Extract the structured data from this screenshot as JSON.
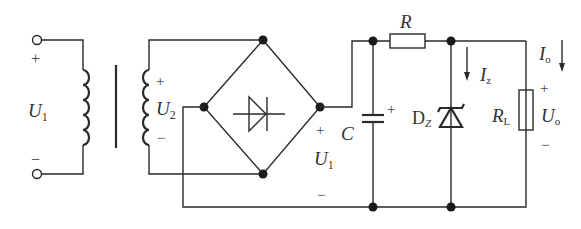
{
  "diagram": {
    "type": "circuit-schematic",
    "colors": {
      "line": "#2a2a2a",
      "node": "#1a1a1a",
      "text": "#333333",
      "background": "#ffffff"
    },
    "labels": {
      "input_voltage": {
        "main": "U",
        "sub": "1"
      },
      "input_plus": "+",
      "input_minus": "−",
      "secondary_voltage": {
        "main": "U",
        "sub": "2"
      },
      "secondary_plus": "+",
      "secondary_minus": "−",
      "rectified_voltage": {
        "main": "U",
        "sub": "1"
      },
      "rectified_plus": "+",
      "rectified_minus": "−",
      "capacitor": "C",
      "capacitor_plus": "+",
      "resistor": "R",
      "zener": {
        "main": "D",
        "sub": "Z"
      },
      "zener_current": {
        "main": "I",
        "sub": "z"
      },
      "load_resistor": {
        "main": "R",
        "sub": "L"
      },
      "output_current": {
        "main": "I",
        "sub": "o"
      },
      "output_voltage": {
        "main": "U",
        "sub": "o"
      },
      "output_plus": "+",
      "output_minus": "−"
    },
    "components": [
      {
        "id": "T",
        "kind": "transformer"
      },
      {
        "id": "bridge",
        "kind": "bridge-rectifier"
      },
      {
        "id": "C",
        "kind": "polarized-capacitor"
      },
      {
        "id": "R",
        "kind": "resistor"
      },
      {
        "id": "DZ",
        "kind": "zener-diode"
      },
      {
        "id": "RL",
        "kind": "load-resistor"
      }
    ]
  }
}
